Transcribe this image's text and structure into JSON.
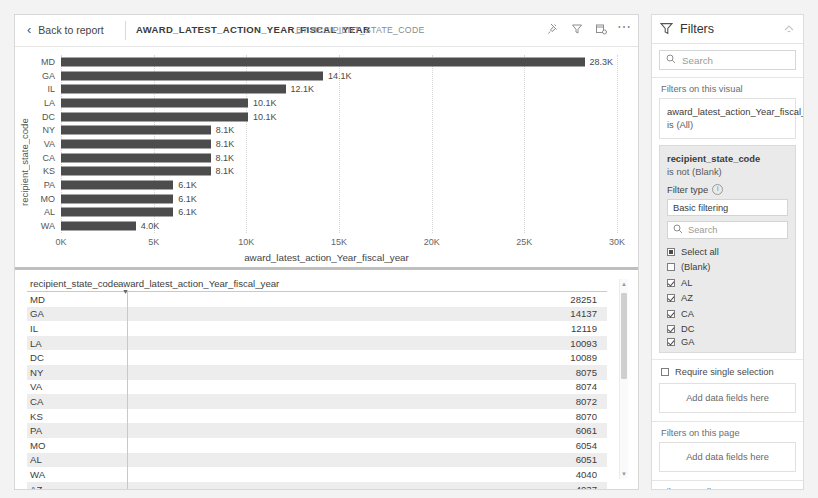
{
  "header": {
    "back_label": "Back to report",
    "title": "AWARD_LATEST_ACTION_YEAR_FISCAL_YEAR",
    "subtitle": "BY RECIPIENT_STATE_CODE",
    "icons": [
      "pin-icon",
      "filter-icon",
      "focus-mode-icon",
      "more-options-icon"
    ]
  },
  "chart_data": {
    "type": "bar",
    "orientation": "horizontal",
    "title": "AWARD_LATEST_ACTION_YEAR_FISCAL_YEAR BY RECIPIENT_STATE_CODE",
    "xlabel": "award_latest_action_Year_fiscal_year",
    "ylabel": "recipient_state_code",
    "xlim": [
      0,
      30000
    ],
    "xticks": [
      "0K",
      "5K",
      "10K",
      "15K",
      "20K",
      "25K",
      "30K"
    ],
    "xtick_values": [
      0,
      5000,
      10000,
      15000,
      20000,
      25000,
      30000
    ],
    "grid": true,
    "bar_color": "#4c4c4c",
    "categories": [
      "MD",
      "GA",
      "IL",
      "LA",
      "DC",
      "NY",
      "VA",
      "CA",
      "KS",
      "PA",
      "MO",
      "AL",
      "WA"
    ],
    "values": [
      28251,
      14137,
      12119,
      10093,
      10089,
      8075,
      8074,
      8072,
      8070,
      6061,
      6054,
      6051,
      4040
    ],
    "data_labels": [
      "28.3K",
      "14.1K",
      "12.1K",
      "10.1K",
      "10.1K",
      "8.1K",
      "8.1K",
      "8.1K",
      "8.1K",
      "6.1K",
      "6.1K",
      "6.1K",
      "4.0K"
    ]
  },
  "table": {
    "columns": [
      "recipient_state_code",
      "award_latest_action_Year_fiscal_year"
    ],
    "sort_column": "award_latest_action_Year_fiscal_year",
    "sort_direction": "descending",
    "rows": [
      {
        "state": "MD",
        "value": "28251"
      },
      {
        "state": "GA",
        "value": "14137"
      },
      {
        "state": "IL",
        "value": "12119"
      },
      {
        "state": "LA",
        "value": "10093"
      },
      {
        "state": "DC",
        "value": "10089"
      },
      {
        "state": "NY",
        "value": "8075"
      },
      {
        "state": "VA",
        "value": "8074"
      },
      {
        "state": "CA",
        "value": "8072"
      },
      {
        "state": "KS",
        "value": "8070"
      },
      {
        "state": "PA",
        "value": "6061"
      },
      {
        "state": "MO",
        "value": "6054"
      },
      {
        "state": "AL",
        "value": "6051"
      },
      {
        "state": "WA",
        "value": "4040"
      },
      {
        "state": "AZ",
        "value": "4037"
      }
    ]
  },
  "filters": {
    "title": "Filters",
    "search_placeholder": "Search",
    "section_visual": "Filters on this visual",
    "card1": {
      "field": "award_latest_action_Year_fiscal_year",
      "condition": "is (All)"
    },
    "card2": {
      "field": "recipient_state_code",
      "condition": "is not (Blank)",
      "filter_type_label": "Filter type",
      "filter_type_value": "Basic filtering",
      "list_search_placeholder": "Search",
      "items": [
        {
          "label": "Select all",
          "state": "filled"
        },
        {
          "label": "(Blank)",
          "state": "unchecked"
        },
        {
          "label": "AL",
          "state": "checked"
        },
        {
          "label": "AZ",
          "state": "checked"
        },
        {
          "label": "CA",
          "state": "checked"
        },
        {
          "label": "DC",
          "state": "checked"
        },
        {
          "label": "GA",
          "state": "checked"
        }
      ],
      "require_single": "Require single selection"
    },
    "dropzone_visual": "Add data fields here",
    "section_page": "Filters on this page",
    "dropzone_page": "Add data fields here",
    "section_all": "Filters on all pages",
    "dropzone_all": "Add data fields here"
  }
}
